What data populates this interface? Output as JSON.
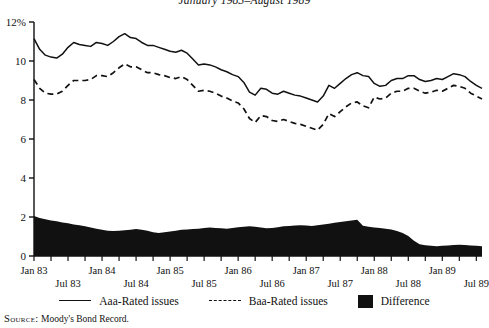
{
  "figure": {
    "title": "January 1983–August 1989",
    "source_label": "Source:",
    "source_text": "Moody's Bond Record."
  },
  "legend": {
    "items": [
      {
        "key": "solid-line",
        "label": "Aaa-Rated issues"
      },
      {
        "key": "dashed-line",
        "label": "Baa-Rated issues"
      },
      {
        "key": "filled-block",
        "label": "Difference"
      }
    ]
  },
  "chart_data": {
    "type": "line",
    "title": "January 1983–August 1989",
    "xlabel": "",
    "ylabel": "",
    "ylim": [
      0,
      12
    ],
    "ytick_labels": [
      "0",
      "2",
      "4",
      "6",
      "8",
      "10",
      "12%"
    ],
    "ytick_values": [
      0,
      2,
      4,
      6,
      8,
      10,
      12
    ],
    "grid": false,
    "legend_position": "bottom",
    "x_axis_unit": "month",
    "x_range": [
      "Jan 83",
      "Aug 89"
    ],
    "xtick_labels_upper": [
      "Jan 83",
      "Jan 84",
      "Jan 85",
      "Jan 86",
      "Jan 87",
      "Jan 88",
      "Jan 89"
    ],
    "xtick_labels_lower": [
      "Jul 83",
      "Jul 84",
      "Jul 85",
      "Jul 86",
      "Jul 87",
      "Jul 88",
      "Jul 89"
    ],
    "x": [
      "Jan 83",
      "Feb 83",
      "Mar 83",
      "Apr 83",
      "May 83",
      "Jun 83",
      "Jul 83",
      "Aug 83",
      "Sep 83",
      "Oct 83",
      "Nov 83",
      "Dec 83",
      "Jan 84",
      "Feb 84",
      "Mar 84",
      "Apr 84",
      "May 84",
      "Jun 84",
      "Jul 84",
      "Aug 84",
      "Sep 84",
      "Oct 84",
      "Nov 84",
      "Dec 84",
      "Jan 85",
      "Feb 85",
      "Mar 85",
      "Apr 85",
      "May 85",
      "Jun 85",
      "Jul 85",
      "Aug 85",
      "Sep 85",
      "Oct 85",
      "Nov 85",
      "Dec 85",
      "Jan 86",
      "Feb 86",
      "Mar 86",
      "Apr 86",
      "May 86",
      "Jun 86",
      "Jul 86",
      "Aug 86",
      "Sep 86",
      "Oct 86",
      "Nov 86",
      "Dec 86",
      "Jan 87",
      "Feb 87",
      "Mar 87",
      "Apr 87",
      "May 87",
      "Jun 87",
      "Jul 87",
      "Aug 87",
      "Sep 87",
      "Oct 87",
      "Nov 87",
      "Dec 87",
      "Jan 88",
      "Feb 88",
      "Mar 88",
      "Apr 88",
      "May 88",
      "Jun 88",
      "Jul 88",
      "Aug 88",
      "Sep 88",
      "Oct 88",
      "Nov 88",
      "Dec 88",
      "Jan 89",
      "Feb 89",
      "Mar 89",
      "Apr 89",
      "May 89",
      "Jun 89",
      "Jul 89",
      "Aug 89"
    ],
    "series": [
      {
        "name": "Aaa-Rated issues",
        "style": "solid",
        "color": "#111111",
        "values": [
          11.15,
          10.6,
          10.3,
          10.2,
          10.15,
          10.35,
          10.7,
          10.95,
          10.85,
          10.8,
          10.75,
          10.95,
          10.9,
          10.8,
          11.0,
          11.25,
          11.4,
          11.2,
          11.15,
          10.95,
          10.8,
          10.8,
          10.7,
          10.6,
          10.5,
          10.45,
          10.55,
          10.4,
          10.1,
          9.8,
          9.85,
          9.8,
          9.7,
          9.55,
          9.45,
          9.3,
          9.2,
          8.9,
          8.4,
          8.25,
          8.6,
          8.55,
          8.35,
          8.3,
          8.45,
          8.35,
          8.25,
          8.2,
          8.1,
          8.0,
          7.9,
          8.2,
          8.75,
          8.6,
          8.85,
          9.1,
          9.3,
          9.4,
          9.25,
          9.2,
          8.85,
          8.7,
          8.75,
          9.0,
          9.1,
          9.1,
          9.25,
          9.25,
          9.05,
          8.95,
          9.0,
          9.1,
          9.05,
          9.2,
          9.35,
          9.3,
          9.2,
          8.95,
          8.75,
          8.6
        ]
      },
      {
        "name": "Baa-Rated issues",
        "style": "dashed",
        "color": "#111111",
        "values": [
          9.05,
          8.6,
          8.35,
          8.3,
          8.3,
          8.45,
          8.75,
          9.0,
          9.0,
          9.0,
          9.05,
          9.25,
          9.25,
          9.2,
          9.4,
          9.65,
          9.85,
          9.7,
          9.7,
          9.55,
          9.4,
          9.4,
          9.3,
          9.25,
          9.15,
          9.1,
          9.2,
          9.05,
          8.75,
          8.45,
          8.5,
          8.45,
          8.35,
          8.2,
          8.1,
          7.95,
          7.85,
          7.55,
          7.05,
          6.85,
          7.2,
          7.15,
          6.95,
          6.9,
          7.0,
          6.9,
          6.8,
          6.75,
          6.65,
          6.55,
          6.45,
          6.75,
          7.3,
          7.15,
          7.4,
          7.65,
          7.85,
          7.9,
          7.7,
          7.6,
          8.15,
          8.05,
          8.1,
          8.35,
          8.45,
          8.45,
          8.6,
          8.6,
          8.45,
          8.35,
          8.4,
          8.5,
          8.45,
          8.6,
          8.75,
          8.7,
          8.6,
          8.35,
          8.2,
          8.05
        ]
      }
    ],
    "difference_series": {
      "name": "Difference",
      "style": "filled-area",
      "color": "#111111",
      "values": [
        2.05,
        1.95,
        1.88,
        1.82,
        1.78,
        1.72,
        1.68,
        1.62,
        1.58,
        1.52,
        1.46,
        1.4,
        1.35,
        1.3,
        1.28,
        1.3,
        1.32,
        1.34,
        1.38,
        1.34,
        1.3,
        1.22,
        1.18,
        1.22,
        1.26,
        1.3,
        1.34,
        1.36,
        1.38,
        1.4,
        1.44,
        1.46,
        1.44,
        1.42,
        1.4,
        1.44,
        1.48,
        1.5,
        1.52,
        1.5,
        1.46,
        1.42,
        1.44,
        1.48,
        1.52,
        1.54,
        1.56,
        1.58,
        1.56,
        1.54,
        1.58,
        1.62,
        1.66,
        1.7,
        1.74,
        1.78,
        1.82,
        1.86,
        1.55,
        1.5,
        1.46,
        1.44,
        1.4,
        1.36,
        1.28,
        1.18,
        1.02,
        0.78,
        0.6,
        0.55,
        0.52,
        0.5,
        0.52,
        0.54,
        0.56,
        0.58,
        0.56,
        0.54,
        0.52,
        0.5
      ]
    }
  }
}
